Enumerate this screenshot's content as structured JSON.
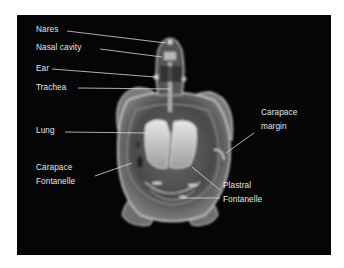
{
  "figure": {
    "background_color": "#050505",
    "label_color": "#e6e6e6",
    "labels": [
      {
        "id": "nares",
        "text": "Nares",
        "x": 36,
        "y": 25,
        "line": [
          67,
          31,
          166,
          43
        ]
      },
      {
        "id": "nasal-cavity",
        "text": "Nasal cavity",
        "x": 36,
        "y": 43,
        "line": [
          100,
          49,
          162,
          57
        ]
      },
      {
        "id": "ear",
        "text": "Ear",
        "x": 36,
        "y": 64,
        "line": [
          52,
          69,
          155,
          77
        ]
      },
      {
        "id": "trachea",
        "text": "Trachea",
        "x": 36,
        "y": 83,
        "line": [
          78,
          88,
          171,
          89
        ]
      },
      {
        "id": "lung",
        "text": "Lung",
        "x": 36,
        "y": 126,
        "line": [
          65,
          132,
          148,
          133
        ]
      },
      {
        "id": "carapace-fontanelle-1",
        "text": "Carapace",
        "x": 36,
        "y": 163
      },
      {
        "id": "carapace-fontanelle-2",
        "text": "Fontanelle",
        "x": 36,
        "y": 177,
        "line": [
          95,
          176,
          132,
          163
        ]
      },
      {
        "id": "carapace-margin-1",
        "text": "Carapace",
        "x": 261,
        "y": 108
      },
      {
        "id": "carapace-margin-2",
        "text": "margin",
        "x": 261,
        "y": 122,
        "line": [
          254,
          133,
          226,
          153
        ]
      },
      {
        "id": "plastral-fontanelle-1",
        "text": "Plastral",
        "x": 223,
        "y": 181
      },
      {
        "id": "plastral-fontanelle-2",
        "text": "Fontanelle",
        "x": 223,
        "y": 195,
        "line": [
          220,
          190,
          192,
          167
        ],
        "line2": [
          220,
          198,
          182,
          198
        ]
      }
    ]
  }
}
